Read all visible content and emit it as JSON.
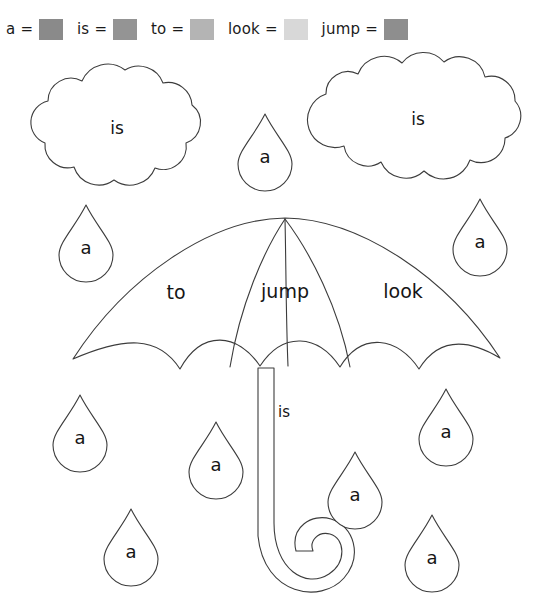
{
  "worksheet": {
    "title": "Color by sight word umbrella and raindrops worksheet",
    "background_color": "#ffffff",
    "outline_color": "#3c3c3c"
  },
  "legend": {
    "name": "color-key",
    "separator": "=",
    "items": [
      {
        "word": "a",
        "swatch_color": "#8a8a8a"
      },
      {
        "word": "is",
        "swatch_color": "#949494"
      },
      {
        "word": "to",
        "swatch_color": "#b4b4b4"
      },
      {
        "word": "look",
        "swatch_color": "#d8d8d8"
      },
      {
        "word": "jump",
        "swatch_color": "#8e8e8e"
      }
    ]
  },
  "shapes": {
    "clouds": [
      {
        "id": "cloud-left",
        "word": "is",
        "cx": 117,
        "cy": 128
      },
      {
        "id": "cloud-right",
        "word": "is",
        "cx": 418,
        "cy": 119
      }
    ],
    "umbrella": {
      "id": "umbrella",
      "panels": [
        {
          "id": "umbrella-panel-left",
          "word": "to",
          "cx": 176,
          "cy": 292
        },
        {
          "id": "umbrella-panel-center",
          "word": "jump",
          "cx": 285,
          "cy": 291
        },
        {
          "id": "umbrella-panel-right",
          "word": "look",
          "cx": 403,
          "cy": 291
        }
      ],
      "handle": {
        "id": "umbrella-handle",
        "word": "is",
        "cx": 284,
        "cy": 412
      }
    },
    "raindrops": [
      {
        "id": "raindrop-top-center",
        "word": "a",
        "cx": 265,
        "cy": 156
      },
      {
        "id": "raindrop-upper-left",
        "word": "a",
        "cx": 86,
        "cy": 247
      },
      {
        "id": "raindrop-upper-right",
        "word": "a",
        "cx": 480,
        "cy": 241
      },
      {
        "id": "raindrop-lower-left",
        "word": "a",
        "cx": 80,
        "cy": 437
      },
      {
        "id": "raindrop-mid-left",
        "word": "a",
        "cx": 216,
        "cy": 464
      },
      {
        "id": "raindrop-bottom-left",
        "word": "a",
        "cx": 131,
        "cy": 551
      },
      {
        "id": "raindrop-mid-right",
        "word": "a",
        "cx": 446,
        "cy": 431
      },
      {
        "id": "raindrop-lower-right",
        "word": "a",
        "cx": 355,
        "cy": 494
      },
      {
        "id": "raindrop-bottom-right",
        "word": "a",
        "cx": 432,
        "cy": 557
      }
    ]
  }
}
